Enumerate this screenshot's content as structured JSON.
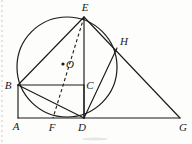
{
  "figure": {
    "type": "euclidean-geometry-diagram",
    "background_color": "#fdfdfb",
    "ink_color": "#1a1a1a",
    "canvas": {
      "width": 192,
      "height": 144
    }
  },
  "points": [
    {
      "id": "A",
      "label": "A",
      "x": 18,
      "y": 118,
      "label_x": 16,
      "label_y": 130,
      "on_circle": false
    },
    {
      "id": "B",
      "label": "B",
      "x": 18,
      "y": 85,
      "label_x": 8,
      "label_y": 89,
      "on_circle": true
    },
    {
      "id": "C",
      "label": "C",
      "x": 84,
      "y": 85,
      "label_x": 88,
      "label_y": 89,
      "on_circle": false
    },
    {
      "id": "D",
      "label": "D",
      "x": 84,
      "y": 118,
      "label_x": 82,
      "label_y": 131,
      "on_circle": true
    },
    {
      "id": "E",
      "label": "E",
      "x": 84,
      "y": 17,
      "label_x": 84,
      "label_y": 11,
      "on_circle": true
    },
    {
      "id": "F",
      "label": "F",
      "x": 53,
      "y": 118,
      "label_x": 51,
      "label_y": 131,
      "on_circle": false
    },
    {
      "id": "G",
      "label": "G",
      "x": 180,
      "y": 118,
      "label_x": 182,
      "label_y": 131,
      "on_circle": false
    },
    {
      "id": "H",
      "label": "H",
      "x": 117,
      "y": 48,
      "label_x": 123,
      "label_y": 45,
      "on_circle": true
    },
    {
      "id": "O",
      "label": "O",
      "x": 63,
      "y": 64,
      "label_x": 69,
      "label_y": 68,
      "on_circle": false
    }
  ],
  "circle": {
    "id": "circle-O",
    "center_x": 67,
    "center_y": 67,
    "radius": 50,
    "label": "circle O"
  },
  "segments": [
    {
      "id": "A-G",
      "from": "A",
      "to": "G",
      "style": "solid",
      "x1": 18,
      "y1": 118,
      "x2": 180,
      "y2": 118
    },
    {
      "id": "A-B",
      "from": "A",
      "to": "B",
      "style": "solid",
      "x1": 18,
      "y1": 118,
      "x2": 18,
      "y2": 85
    },
    {
      "id": "B-C",
      "from": "B",
      "to": "C",
      "style": "solid",
      "x1": 18,
      "y1": 85,
      "x2": 84,
      "y2": 85
    },
    {
      "id": "C-D",
      "from": "C",
      "to": "D",
      "style": "solid",
      "x1": 84,
      "y1": 85,
      "x2": 84,
      "y2": 118
    },
    {
      "id": "E-D",
      "from": "E",
      "to": "D",
      "style": "solid",
      "x1": 84,
      "y1": 17,
      "x2": 84,
      "y2": 118
    },
    {
      "id": "E-B",
      "from": "E",
      "to": "B",
      "style": "solid",
      "x1": 84,
      "y1": 17,
      "x2": 18,
      "y2": 85
    },
    {
      "id": "E-G",
      "from": "E",
      "to": "G",
      "style": "solid",
      "x1": 84,
      "y1": 17,
      "x2": 180,
      "y2": 118
    },
    {
      "id": "B-D",
      "from": "B",
      "to": "D",
      "style": "solid",
      "x1": 18,
      "y1": 85,
      "x2": 84,
      "y2": 118
    },
    {
      "id": "D-H",
      "from": "D",
      "to": "H",
      "style": "solid",
      "x1": 84,
      "y1": 118,
      "x2": 117,
      "y2": 48
    },
    {
      "id": "E-F",
      "from": "E",
      "to": "F",
      "style": "dashed",
      "x1": 84,
      "y1": 17,
      "x2": 53,
      "y2": 118
    }
  ],
  "arcs": [
    {
      "id": "arc-E-H-D",
      "note": "circle arc from E through H down to D",
      "from": "E",
      "to": "D",
      "through": "H"
    },
    {
      "id": "arc-B-F-D",
      "note": "lower left circle arc from B through near F to D",
      "from": "B",
      "to": "D"
    }
  ],
  "caption": {
    "text": "",
    "visible": false
  }
}
